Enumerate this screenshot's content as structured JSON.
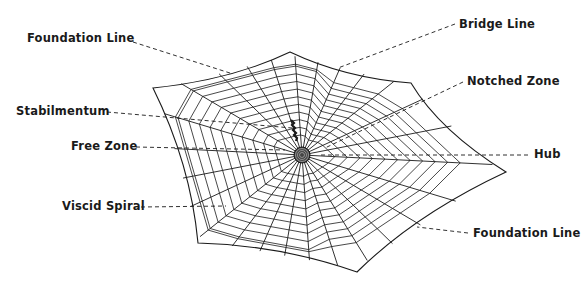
{
  "diagram": {
    "colors": {
      "line": "#1a1a1a",
      "background": "#ffffff"
    },
    "hub": {
      "x": 302,
      "y": 155
    },
    "frame": [
      [
        153,
        88
      ],
      [
        290,
        52
      ],
      [
        411,
        83
      ],
      [
        506,
        172
      ],
      [
        357,
        272
      ],
      [
        198,
        243
      ]
    ],
    "labels": [
      {
        "id": "foundation-line-top",
        "text": "Foundation Line",
        "x": 27,
        "y": 31,
        "leader": [
          [
            133,
            42
          ],
          [
            233,
            74
          ]
        ]
      },
      {
        "id": "bridge-line",
        "text": "Bridge Line",
        "x": 459,
        "y": 17,
        "leader": [
          [
            455,
            24
          ],
          [
            338,
            68
          ]
        ]
      },
      {
        "id": "notched-zone",
        "text": "Notched Zone",
        "x": 467,
        "y": 74,
        "leader": [
          [
            463,
            82
          ],
          [
            325,
            148
          ]
        ]
      },
      {
        "id": "stabilmentum",
        "text": "Stabilmentum",
        "x": 16,
        "y": 104,
        "leader": [
          [
            107,
            112
          ],
          [
            292,
            128
          ]
        ]
      },
      {
        "id": "free-zone",
        "text": "Free Zone",
        "x": 71,
        "y": 139,
        "leader": [
          [
            136,
            147
          ],
          [
            285,
            150
          ]
        ]
      },
      {
        "id": "hub",
        "text": "Hub",
        "x": 534,
        "y": 147,
        "leader": [
          [
            528,
            155
          ],
          [
            318,
            155
          ]
        ]
      },
      {
        "id": "viscid-spiral",
        "text": "Viscid Spiral",
        "x": 62,
        "y": 199,
        "leader": [
          [
            141,
            207
          ],
          [
            226,
            206
          ]
        ]
      },
      {
        "id": "foundation-line-bottom",
        "text": "Foundation Line",
        "x": 473,
        "y": 226,
        "leader": [
          [
            468,
            233
          ],
          [
            417,
            227
          ]
        ]
      }
    ]
  }
}
